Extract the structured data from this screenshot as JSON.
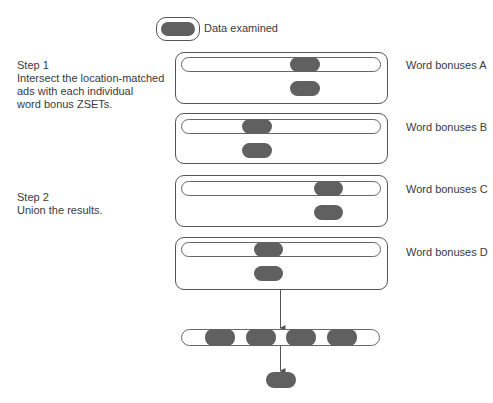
{
  "legend": {
    "label": "Data examined",
    "icon": "data-pill-icon"
  },
  "steps": [
    {
      "title": "Step 1",
      "lines": [
        "Intersect the location-matched",
        "ads with each individual",
        "word bonus ZSETs."
      ]
    },
    {
      "title": "Step 2",
      "lines": [
        "Union the results."
      ]
    }
  ],
  "sets": [
    {
      "label": "Word bonuses A"
    },
    {
      "label": "Word bonuses B"
    },
    {
      "label": "Word bonuses C"
    },
    {
      "label": "Word bonuses D"
    }
  ],
  "colors": {
    "pill": "#606060",
    "outline": "#555555",
    "text": "#3a3a3a"
  }
}
